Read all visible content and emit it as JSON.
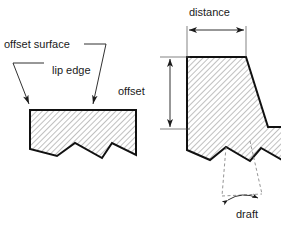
{
  "diagram": {
    "labels": {
      "offset_surface": "offset surface",
      "lip_edge": "lip edge",
      "offset": "offset",
      "distance": "distance",
      "draft": "draft"
    },
    "colors": {
      "outline": "#111111",
      "hatch": "#8c8c8c",
      "text": "#1a1a1a",
      "dashed": "#7a7a7a",
      "background": "#ffffff"
    },
    "shapes": {
      "left_profile_points": "30,110 136,110 136,155 112,143 102,158 75,143 57,156 30,149",
      "right_profile_points": "187,57 246,57 268,127 281,127 281,160 261,148 250,161 226,147 210,160 187,150"
    },
    "annotations": [
      {
        "name": "offset-surface",
        "leader_from": "106,46",
        "leader_to": "92,108"
      },
      {
        "name": "lip-edge",
        "leader_from": "13,64",
        "leader_to": "30,108"
      },
      {
        "name": "offset",
        "type": "vertical-dimension",
        "from_y": 57,
        "to_y": 129,
        "x": 170
      },
      {
        "name": "distance",
        "type": "horizontal-dimension",
        "from_x": 187,
        "to_x": 246,
        "y": 28
      },
      {
        "name": "draft",
        "type": "angle-dimension"
      }
    ]
  }
}
